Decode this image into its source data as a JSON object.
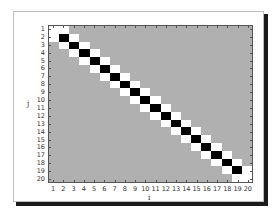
{
  "chart_data": {
    "type": "heatmap",
    "title": "",
    "xlabel": "i",
    "ylabel": "j",
    "x_ticks": [
      "1",
      "2",
      "3",
      "4",
      "5",
      "6",
      "7",
      "8",
      "9",
      "10",
      "11",
      "12",
      "13",
      "14",
      "15",
      "16",
      "17",
      "18",
      "19",
      "20"
    ],
    "y_ticks": [
      "1",
      "2",
      "3",
      "4",
      "5",
      "6",
      "7",
      "8",
      "9",
      "10",
      "11",
      "12",
      "13",
      "14",
      "15",
      "16",
      "17",
      "18",
      "19",
      "20"
    ],
    "y_direction": "top-to-bottom",
    "size": [
      20,
      20
    ],
    "colors": {
      "background": "#b0b0b0",
      "diagonal": "#000000",
      "off_diagonal": "#ffffff",
      "boundary_diagonal": "#ffffff"
    },
    "value_legend": {
      "black": "diagonal value",
      "white": "off-diagonal / boundary value",
      "gray": "zero"
    },
    "matrix_rule": {
      "diagonal_interior": [
        2,
        19
      ],
      "diagonal_boundary": [
        1,
        20
      ],
      "offsets_white": [
        -1,
        1
      ]
    },
    "grid": false,
    "legend": "none"
  },
  "axes": {
    "x_label": "i",
    "y_label": "j"
  }
}
